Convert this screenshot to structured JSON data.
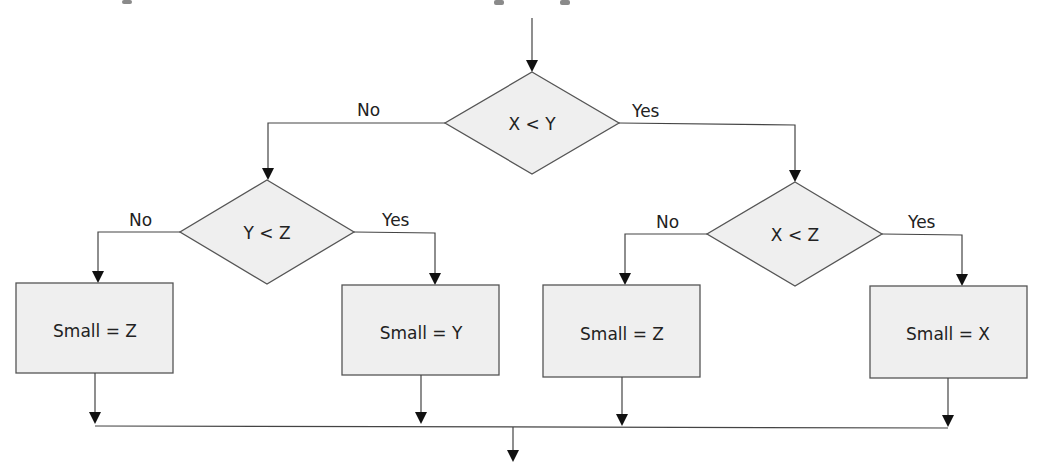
{
  "diagram": {
    "type": "flowchart",
    "decisions": [
      {
        "id": "d1",
        "label": "X < Y",
        "no_label": "No",
        "yes_label": "Yes"
      },
      {
        "id": "d2",
        "label": "Y < Z",
        "no_label": "No",
        "yes_label": "Yes"
      },
      {
        "id": "d3",
        "label": "X < Z",
        "no_label": "No",
        "yes_label": "Yes"
      }
    ],
    "processes": [
      {
        "id": "p1",
        "label": "Small = Z"
      },
      {
        "id": "p2",
        "label": "Small = Y"
      },
      {
        "id": "p3",
        "label": "Small = Z"
      },
      {
        "id": "p4",
        "label": "Small = X"
      }
    ],
    "edges": [
      {
        "from": "start",
        "to": "d1"
      },
      {
        "from": "d1",
        "to": "d2",
        "label": "No"
      },
      {
        "from": "d1",
        "to": "d3",
        "label": "Yes"
      },
      {
        "from": "d2",
        "to": "p1",
        "label": "No"
      },
      {
        "from": "d2",
        "to": "p2",
        "label": "Yes"
      },
      {
        "from": "d3",
        "to": "p3",
        "label": "No"
      },
      {
        "from": "d3",
        "to": "p4",
        "label": "Yes"
      },
      {
        "from": "p1",
        "to": "end"
      },
      {
        "from": "p2",
        "to": "end"
      },
      {
        "from": "p3",
        "to": "end"
      },
      {
        "from": "p4",
        "to": "end"
      }
    ],
    "colors": {
      "fill": "#efefef",
      "stroke": "#555555",
      "arrow": "#111111",
      "text": "#222222"
    }
  }
}
